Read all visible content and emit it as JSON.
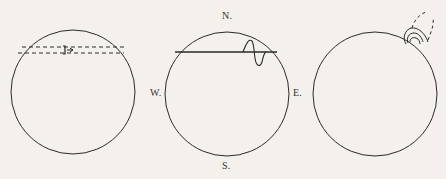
{
  "figure": {
    "panels": [
      {
        "id": "panel-1",
        "description": "circle with two dashed parallel horizontal lines near top and small bracket-arrow mark"
      },
      {
        "id": "panel-2",
        "description": "circle with compass labels and horizontal chord with S-shaped wave near right end",
        "labels": {
          "north": "N.",
          "south": "S.",
          "west": "W.",
          "east": "E."
        }
      },
      {
        "id": "panel-3",
        "description": "circle with nested looping curve lines at upper right edge, dashed extension"
      }
    ]
  },
  "colors": {
    "line": "#2a2a2a",
    "background": "#f4f1ec"
  }
}
